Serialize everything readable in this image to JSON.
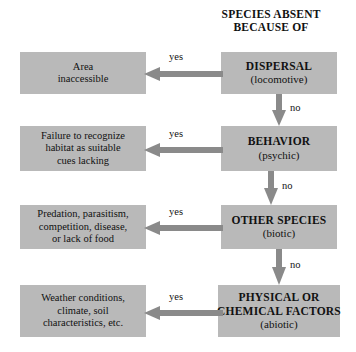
{
  "diagram": {
    "title": "SPECIES ABSENT\nBECAUSE OF",
    "title_line1": "SPECIES ABSENT",
    "title_line2": "BECAUSE OF",
    "colors": {
      "box_fill": "#b9b9b9",
      "arrow": "#8a8a8a",
      "background": "#ffffff",
      "text": "#111111"
    },
    "yes_label": "yes",
    "no_label": "no",
    "steps": [
      {
        "id": "dispersal",
        "cause_head": "DISPERSAL",
        "cause_sub": "(locomotive)",
        "yes": "yes",
        "no": "no",
        "outcome_lines": [
          "Area",
          "inaccessible"
        ]
      },
      {
        "id": "behavior",
        "cause_head": "BEHAVIOR",
        "cause_sub": "(psychic)",
        "yes": "yes",
        "no": "no",
        "outcome_lines": [
          "Failure to recognize",
          "habitat as suitable",
          "cues lacking"
        ]
      },
      {
        "id": "other-species",
        "cause_head": "OTHER SPECIES",
        "cause_sub": "(biotic)",
        "yes": "yes",
        "no": "no",
        "outcome_lines": [
          "Predation, parasitism,",
          "competition, disease,",
          "or lack of food"
        ]
      },
      {
        "id": "physical-chemical",
        "cause_head_line1": "PHYSICAL OR",
        "cause_head_line2": "CHEMICAL FACTORS",
        "cause_sub": "(abiotic)",
        "yes": "yes",
        "outcome_lines": [
          "Weather conditions,",
          "climate, soil",
          "characteristics, etc."
        ]
      }
    ]
  }
}
